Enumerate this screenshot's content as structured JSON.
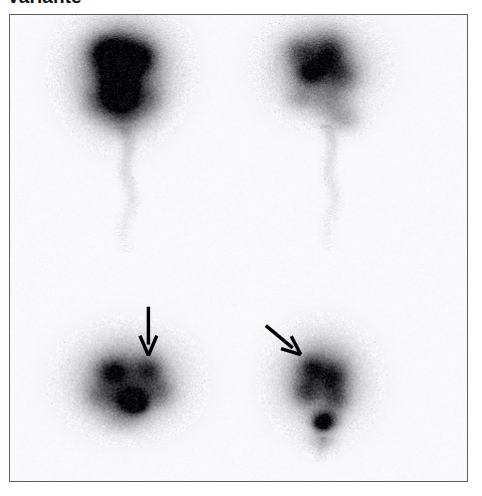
{
  "figure": {
    "title": "Variante",
    "modality": "thyroid scintigraphy",
    "frame": {
      "x": 9,
      "y": 14,
      "width": 459,
      "height": 468,
      "border_color": "#5d5d5d",
      "background_color": "#ffffff"
    }
  },
  "panels": [
    {
      "id": "panel-top-left",
      "name": "top-left-scan",
      "position": "top-left",
      "center": [
        122,
        78
      ],
      "intensity": "very-high",
      "description": "dense near-black butterfly uptake with faint descending trail",
      "blobs": [
        {
          "cx": 122,
          "cy": 62,
          "rx": 46,
          "ry": 42,
          "level": 0.34
        },
        {
          "cx": 120,
          "cy": 82,
          "rx": 40,
          "ry": 46,
          "level": 0.4
        },
        {
          "cx": 119,
          "cy": 57,
          "rx": 26,
          "ry": 22,
          "level": 0.92
        },
        {
          "cx": 118,
          "cy": 74,
          "rx": 16,
          "ry": 26,
          "level": 0.95
        },
        {
          "cx": 120,
          "cy": 96,
          "rx": 19,
          "ry": 18,
          "level": 0.88
        },
        {
          "cx": 104,
          "cy": 50,
          "rx": 16,
          "ry": 14,
          "level": 0.55
        },
        {
          "cx": 141,
          "cy": 56,
          "rx": 15,
          "ry": 15,
          "level": 0.5
        },
        {
          "cx": 98,
          "cy": 100,
          "rx": 18,
          "ry": 18,
          "level": 0.28
        },
        {
          "cx": 146,
          "cy": 98,
          "rx": 18,
          "ry": 18,
          "level": 0.26
        },
        {
          "cx": 124,
          "cy": 118,
          "rx": 22,
          "ry": 16,
          "level": 0.24
        }
      ],
      "trail": {
        "x": 126,
        "y_start": 126,
        "y_end": 252,
        "width": 15,
        "level": 0.12
      }
    },
    {
      "id": "panel-top-right",
      "name": "top-right-scan",
      "position": "top-right",
      "center": [
        322,
        78
      ],
      "intensity": "moderate",
      "description": "lighter diffuse mottled uptake with faint descending trail",
      "blobs": [
        {
          "cx": 322,
          "cy": 66,
          "rx": 48,
          "ry": 42,
          "level": 0.26
        },
        {
          "cx": 318,
          "cy": 60,
          "rx": 32,
          "ry": 28,
          "level": 0.4
        },
        {
          "cx": 310,
          "cy": 72,
          "rx": 14,
          "ry": 12,
          "level": 0.62
        },
        {
          "cx": 330,
          "cy": 52,
          "rx": 16,
          "ry": 20,
          "level": 0.44
        },
        {
          "cx": 342,
          "cy": 74,
          "rx": 18,
          "ry": 16,
          "level": 0.32
        },
        {
          "cx": 300,
          "cy": 50,
          "rx": 16,
          "ry": 14,
          "level": 0.3
        },
        {
          "cx": 330,
          "cy": 100,
          "rx": 22,
          "ry": 20,
          "level": 0.24
        },
        {
          "cx": 300,
          "cy": 96,
          "rx": 16,
          "ry": 14,
          "level": 0.18
        },
        {
          "cx": 344,
          "cy": 118,
          "rx": 18,
          "ry": 14,
          "level": 0.2
        }
      ],
      "trail": {
        "x": 330,
        "y_start": 124,
        "y_end": 250,
        "width": 14,
        "level": 0.1
      }
    },
    {
      "id": "panel-bottom-left",
      "name": "bottom-left-scan",
      "position": "bottom-left",
      "center": [
        128,
        385
      ],
      "intensity": "moderate-high",
      "description": "oblique uptake band with dark hot spot in lower portion, marked by arrow",
      "blobs": [
        {
          "cx": 128,
          "cy": 382,
          "rx": 52,
          "ry": 42,
          "level": 0.26
        },
        {
          "cx": 126,
          "cy": 378,
          "rx": 40,
          "ry": 32,
          "level": 0.36
        },
        {
          "cx": 112,
          "cy": 372,
          "rx": 16,
          "ry": 13,
          "level": 0.6
        },
        {
          "cx": 148,
          "cy": 370,
          "rx": 14,
          "ry": 14,
          "level": 0.42
        },
        {
          "cx": 130,
          "cy": 400,
          "rx": 17,
          "ry": 13,
          "level": 0.93
        },
        {
          "cx": 136,
          "cy": 404,
          "rx": 10,
          "ry": 9,
          "level": 0.96
        },
        {
          "cx": 100,
          "cy": 396,
          "rx": 18,
          "ry": 16,
          "level": 0.26
        },
        {
          "cx": 158,
          "cy": 392,
          "rx": 16,
          "ry": 16,
          "level": 0.28
        },
        {
          "cx": 124,
          "cy": 418,
          "rx": 24,
          "ry": 14,
          "level": 0.2
        }
      ],
      "trail": null
    },
    {
      "id": "panel-bottom-right",
      "name": "bottom-right-scan",
      "position": "bottom-right",
      "center": [
        322,
        390
      ],
      "intensity": "moderate",
      "description": "mottled uptake with dark focus at inferior pole, marked by oblique arrow",
      "blobs": [
        {
          "cx": 322,
          "cy": 382,
          "rx": 42,
          "ry": 44,
          "level": 0.24
        },
        {
          "cx": 320,
          "cy": 376,
          "rx": 32,
          "ry": 32,
          "level": 0.34
        },
        {
          "cx": 312,
          "cy": 368,
          "rx": 14,
          "ry": 13,
          "level": 0.44
        },
        {
          "cx": 334,
          "cy": 378,
          "rx": 14,
          "ry": 16,
          "level": 0.46
        },
        {
          "cx": 306,
          "cy": 392,
          "rx": 14,
          "ry": 14,
          "level": 0.38
        },
        {
          "cx": 336,
          "cy": 400,
          "rx": 14,
          "ry": 13,
          "level": 0.36
        },
        {
          "cx": 325,
          "cy": 420,
          "rx": 14,
          "ry": 11,
          "level": 0.78
        },
        {
          "cx": 322,
          "cy": 424,
          "rx": 8,
          "ry": 7,
          "level": 0.88
        },
        {
          "cx": 322,
          "cy": 440,
          "rx": 16,
          "ry": 12,
          "level": 0.18
        }
      ],
      "trail": {
        "x": 322,
        "y_start": 438,
        "y_end": 462,
        "width": 12,
        "level": 0.1
      }
    }
  ],
  "annotations": [
    {
      "id": "arrow-bottom-left",
      "name": "annotation-arrow-vertical",
      "type": "arrow",
      "direction": "down",
      "from": [
        148,
        307
      ],
      "to": [
        148,
        356
      ],
      "color": "#000000",
      "stroke_width": 3.4,
      "head_width": 17,
      "head_length": 20,
      "points_at": "panel-bottom-left"
    },
    {
      "id": "arrow-bottom-right",
      "name": "annotation-arrow-diagonal",
      "type": "arrow",
      "direction": "down-right",
      "from": [
        266,
        326
      ],
      "to": [
        301,
        355
      ],
      "color": "#000000",
      "stroke_width": 3.4,
      "head_width": 16,
      "head_length": 19,
      "points_at": "panel-bottom-right"
    }
  ],
  "render": {
    "noise_amount": 0.16,
    "grain_scale": 1.0,
    "tint": {
      "r": 0.99,
      "g": 0.99,
      "b": 1.0
    }
  }
}
